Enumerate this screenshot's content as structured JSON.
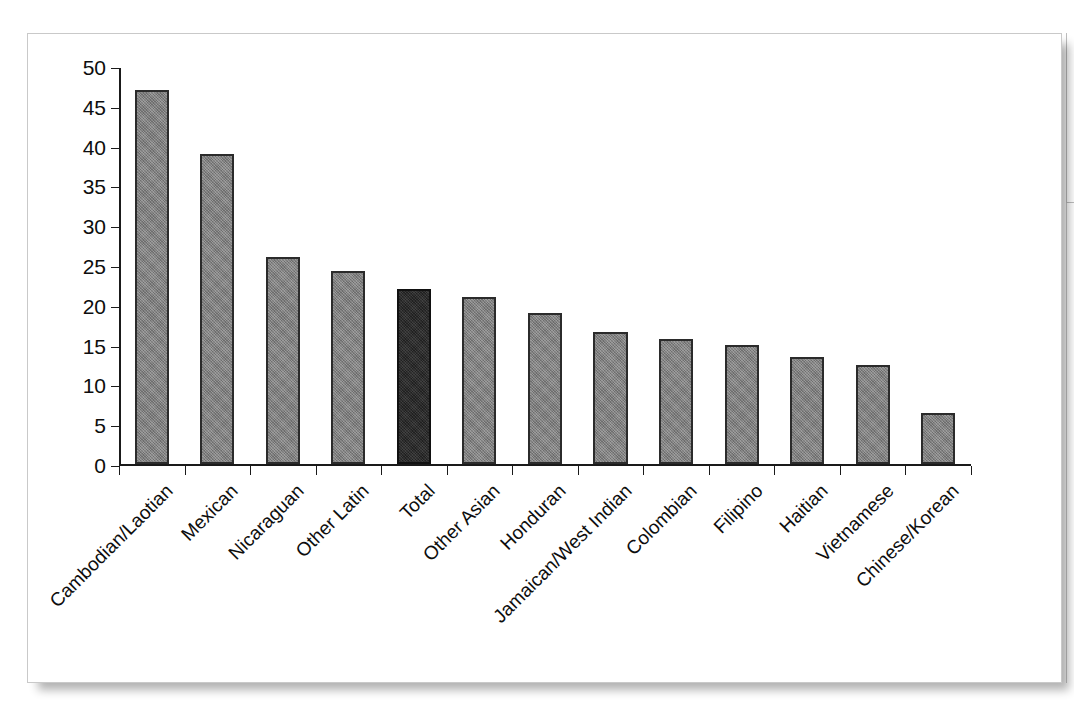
{
  "figure": {
    "background_color": "#ffffff",
    "panel_border_color": "#c9c9c9"
  },
  "chart_data": {
    "type": "bar",
    "title": "",
    "subtitle": "",
    "xlabel": "",
    "ylabel": "",
    "categories": [
      "Cambodian/Laotian",
      "Mexican",
      "Nicaraguan",
      "Other Latin",
      "Total",
      "Other Asian",
      "Honduran",
      "Jamaican/West Indian",
      "Colombian",
      "Filipino",
      "Haitian",
      "Vietnamese",
      "Chinese/Korean"
    ],
    "values": [
      47,
      39,
      26,
      24.3,
      22,
      21,
      19,
      16.6,
      15.7,
      15,
      13.5,
      12.5,
      6.4
    ],
    "highlight_category": "Total",
    "bar_color": "#7c7c7c",
    "highlight_color": "#262626",
    "bar_edge_color": "#2b2b2b",
    "ylim": [
      0,
      50
    ],
    "yticks": [
      0,
      5,
      10,
      15,
      20,
      25,
      30,
      35,
      40,
      45,
      50
    ],
    "ytick_labels": [
      "0",
      "5",
      "10",
      "15",
      "20",
      "25",
      "30",
      "35",
      "40",
      "45",
      "50"
    ],
    "grid": false,
    "legend": null,
    "legend_position": "none",
    "annotations": [],
    "xtick_label_rotation": -45
  }
}
